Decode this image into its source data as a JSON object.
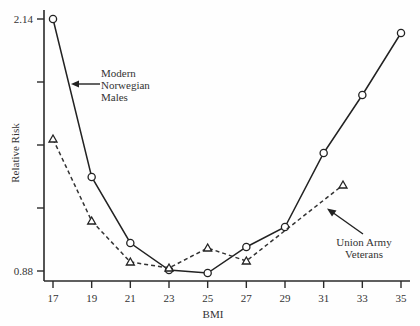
{
  "chart_data": {
    "type": "line",
    "title": "",
    "xlabel": "BMI",
    "ylabel": "Relative Risk",
    "x_ticks": [
      17,
      19,
      21,
      23,
      25,
      27,
      29,
      31,
      33,
      35
    ],
    "y_ticks": [
      0.88,
      1.195,
      1.51,
      1.825,
      2.14
    ],
    "y_tick_labels": [
      {
        "value": 2.14,
        "label": "2.14"
      },
      {
        "value": 0.88,
        "label": "0.88"
      }
    ],
    "xlim": [
      17,
      35
    ],
    "ylim": [
      0.88,
      2.14
    ],
    "grid": false,
    "legend": "none (inline annotations with arrows)",
    "series": [
      {
        "name": "Modern Norwegian Males",
        "style": "solid",
        "marker": "circle",
        "x": [
          17,
          19,
          21,
          23,
          25,
          27,
          29,
          31,
          33,
          35
        ],
        "values": [
          2.14,
          1.35,
          1.02,
          0.885,
          0.87,
          1.0,
          1.1,
          1.47,
          1.76,
          2.07
        ]
      },
      {
        "name": "Union Army Veterans",
        "style": "dashed",
        "marker": "triangle",
        "x": [
          17,
          19,
          21,
          23,
          25,
          27,
          32
        ],
        "values": [
          1.54,
          1.13,
          0.925,
          0.895,
          0.995,
          0.93,
          1.31
        ]
      }
    ],
    "annotations": [
      {
        "lines": [
          "Modern",
          "Norwegian",
          "Males"
        ],
        "points_to": "Modern Norwegian Males"
      },
      {
        "lines": [
          "Union Army",
          "Veterans"
        ],
        "points_to": "Union Army Veterans"
      }
    ]
  }
}
